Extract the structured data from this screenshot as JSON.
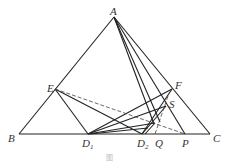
{
  "diagram": {
    "labels": {
      "A": "A",
      "B": "B",
      "C": "C",
      "E": "E",
      "F": "F",
      "S": "S",
      "D1": "D",
      "D1_sub": "1",
      "D2": "D",
      "D2_sub": "2",
      "Q": "Q",
      "P": "P"
    },
    "caption": "图"
  }
}
